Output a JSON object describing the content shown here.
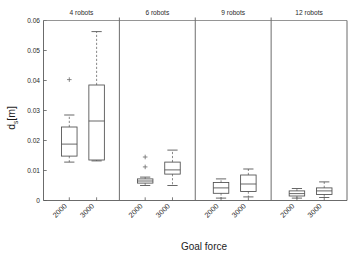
{
  "figure": {
    "title": "",
    "background_color": "#ffffff",
    "line_color": "#4d4d4d",
    "text_color": "#2b2b2b"
  },
  "axes": {
    "ylabel_main": "d",
    "ylabel_sub": "s",
    "ylabel_unit": "[m]",
    "ylabel_full": "d_s [m]",
    "xlabel": "Goal force",
    "ytick_labels": [
      "0",
      "0.01",
      "0.02",
      "0.03",
      "0.04",
      "0.05",
      "0.06"
    ],
    "ytick_values": [
      0,
      0.01,
      0.02,
      0.03,
      0.04,
      0.05,
      0.06
    ],
    "ylim": [
      0,
      0.06
    ],
    "xtick_labels": [
      "2000",
      "3000"
    ],
    "grid": false
  },
  "chart_data": {
    "type": "box",
    "title": "",
    "xlabel": "Goal force",
    "ylabel": "d_s [m]",
    "ylim": [
      0,
      0.06
    ],
    "grid": false,
    "legend_position": "none",
    "panels": [
      {
        "label": "4 robots",
        "boxes": [
          {
            "category": "2000",
            "whisker_low": 0.0128,
            "q1": 0.0148,
            "median": 0.0188,
            "q3": 0.0245,
            "whisker_high": 0.0285,
            "outliers": [
              0.0403
            ]
          },
          {
            "category": "3000",
            "whisker_low": 0.0132,
            "q1": 0.0135,
            "median": 0.0265,
            "q3": 0.0385,
            "whisker_high": 0.0563,
            "outliers": []
          }
        ]
      },
      {
        "label": "6 robots",
        "boxes": [
          {
            "category": "2000",
            "whisker_low": 0.005,
            "q1": 0.0058,
            "median": 0.0065,
            "q3": 0.0072,
            "whisker_high": 0.0078,
            "outliers": [
              0.0112,
              0.0145
            ]
          },
          {
            "category": "3000",
            "whisker_low": 0.005,
            "q1": 0.0088,
            "median": 0.0102,
            "q3": 0.0128,
            "whisker_high": 0.0168,
            "outliers": []
          }
        ]
      },
      {
        "label": "9 robots",
        "boxes": [
          {
            "category": "2000",
            "whisker_low": 0.0008,
            "q1": 0.0024,
            "median": 0.0042,
            "q3": 0.006,
            "whisker_high": 0.0072,
            "outliers": []
          },
          {
            "category": "3000",
            "whisker_low": 0.0012,
            "q1": 0.003,
            "median": 0.0055,
            "q3": 0.0085,
            "whisker_high": 0.0105,
            "outliers": []
          }
        ]
      },
      {
        "label": "12 robots",
        "boxes": [
          {
            "category": "2000",
            "whisker_low": 0.0008,
            "q1": 0.0015,
            "median": 0.0023,
            "q3": 0.0032,
            "whisker_high": 0.004,
            "outliers": []
          },
          {
            "category": "3000",
            "whisker_low": 0.001,
            "q1": 0.002,
            "median": 0.0032,
            "q3": 0.0042,
            "whisker_high": 0.0062,
            "outliers": []
          }
        ]
      }
    ]
  }
}
